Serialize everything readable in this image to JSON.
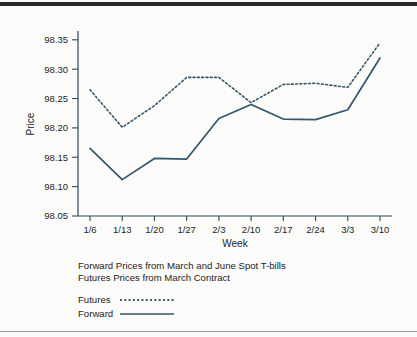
{
  "figure": {
    "y_axis_label": "Price",
    "x_axis_label": "Week",
    "caption_line1": "Forward Prices from March and June Spot T-bills",
    "caption_line2": "Futures Prices from March Contract",
    "legend": {
      "futures_label": "Futures",
      "forward_label": "Forward"
    },
    "colors": {
      "line": "#34566a",
      "axis": "#2f4a5a",
      "background": "#fbfbfa",
      "top_rule": "#2b2b2b",
      "bottom_rule": "#9a9a9a"
    }
  },
  "chart_data": {
    "type": "line",
    "title": "",
    "subtitle": "",
    "xlabel": "Week",
    "ylabel": "Price",
    "categories": [
      "1/6",
      "1/13",
      "1/20",
      "1/27",
      "2/3",
      "2/10",
      "2/17",
      "2/24",
      "3/3",
      "3/10"
    ],
    "ylim": [
      98.05,
      98.365
    ],
    "yticks": [
      98.05,
      98.1,
      98.15,
      98.2,
      98.25,
      98.3,
      98.35
    ],
    "ytick_labels": [
      "98.05",
      "98.10",
      "98.15",
      "98.20",
      "98.25",
      "98.30",
      "98.35"
    ],
    "grid": false,
    "legend_position": "below-plot-left",
    "series": [
      {
        "name": "Futures",
        "style": "dotted",
        "color": "#34566a",
        "values": [
          98.265,
          98.201,
          98.238,
          98.286,
          98.286,
          98.243,
          98.274,
          98.276,
          98.269,
          98.345
        ]
      },
      {
        "name": "Forward",
        "style": "solid",
        "color": "#34566a",
        "values": [
          98.165,
          98.112,
          98.148,
          98.147,
          98.216,
          98.24,
          98.215,
          98.214,
          98.231,
          98.319
        ]
      }
    ]
  }
}
